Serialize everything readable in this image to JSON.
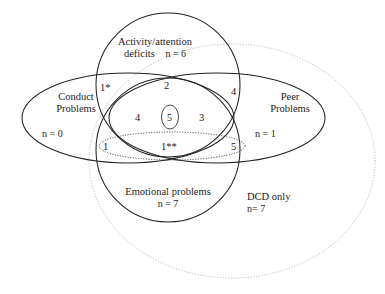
{
  "figure": {
    "type": "venn-diagram",
    "sets": [
      {
        "id": "activity",
        "name": "Activity/attention\ndeficits",
        "name_line1": "Activity/attention",
        "name_line2": "deficits",
        "count_label": "n = 6",
        "shape": "circle",
        "stroke": "#222222",
        "style": "solid"
      },
      {
        "id": "conduct",
        "name_line1": "Conduct",
        "name_line2": "Problems",
        "count_label": "n = 0",
        "shape": "ellipse",
        "stroke": "#222222",
        "style": "solid"
      },
      {
        "id": "peer",
        "name_line1": "Peer",
        "name_line2": "Problems",
        "count_label": "n = 1",
        "shape": "ellipse",
        "stroke": "#222222",
        "style": "solid"
      },
      {
        "id": "emotional",
        "name_line1": "Emotional problems",
        "name_line2": "",
        "count_label": "n = 7",
        "shape": "circle",
        "stroke": "#222222",
        "style": "solid"
      },
      {
        "id": "dcd",
        "name_line1": "DCD only",
        "name_line2": "",
        "count_label": "n= 7",
        "shape": "ellipse",
        "stroke": "#b9b9b9",
        "style": "dotted"
      }
    ],
    "region_counts": [
      {
        "id": "conduct-activity",
        "label": "1*",
        "x": 100,
        "y": 82
      },
      {
        "id": "activity-top-center",
        "label": "2",
        "x": 164,
        "y": 80
      },
      {
        "id": "activity-peer",
        "label": "4",
        "x": 231,
        "y": 86
      },
      {
        "id": "conduct-activity-emotional",
        "label": "4",
        "x": 135,
        "y": 112
      },
      {
        "id": "all-four-center",
        "label": "5",
        "x": 167,
        "y": 112
      },
      {
        "id": "activity-peer-emotional",
        "label": "3",
        "x": 199,
        "y": 112
      },
      {
        "id": "conduct-emotional",
        "label": "1",
        "x": 103,
        "y": 141
      },
      {
        "id": "emotional-dcd-center",
        "label": "1**",
        "x": 161,
        "y": 141
      },
      {
        "id": "peer-emotional",
        "label": "5",
        "x": 231,
        "y": 141
      }
    ],
    "colors": {
      "stroke_dark": "#222222",
      "stroke_light": "#b9b9b9",
      "background": "#ffffff",
      "text": "#1c1c1c"
    }
  }
}
